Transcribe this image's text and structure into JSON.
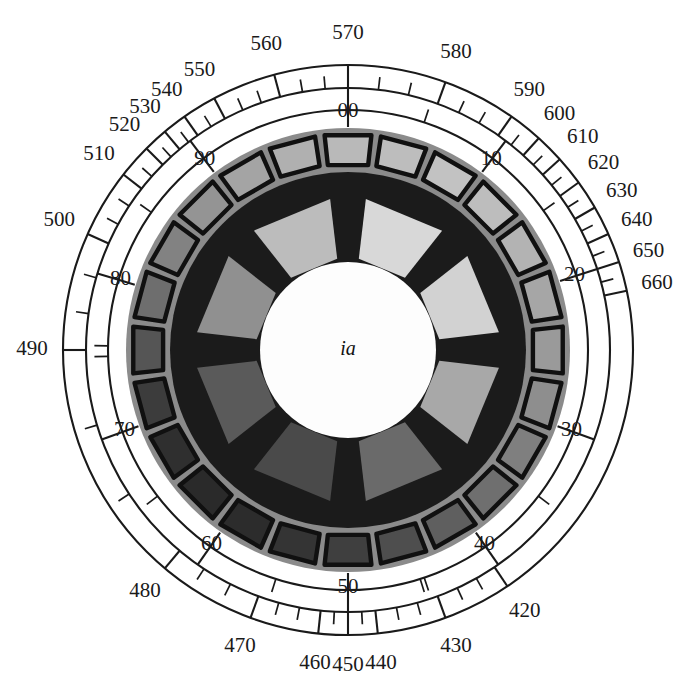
{
  "figure": {
    "type": "machine-cross-section-with-angular-scale",
    "center_label": "ia",
    "background_color": "#ffffff",
    "line_color": "#1a1a1a"
  },
  "outer_scale": {
    "name": "outer-graduated-ring",
    "labels": [
      "420",
      "430",
      "440",
      "450",
      "460",
      "470",
      "480",
      "490",
      "500",
      "510",
      "520",
      "530",
      "540",
      "550",
      "560",
      "570",
      "580",
      "590",
      "600",
      "610",
      "620",
      "630",
      "640",
      "650",
      "660"
    ],
    "label_angles_deg": [
      56,
      70,
      84,
      90,
      96,
      110,
      130,
      180,
      204,
      218,
      225,
      230,
      235,
      242,
      255,
      270,
      290,
      305,
      312,
      318,
      324,
      330,
      336,
      342,
      348
    ],
    "label_radius": 316
  },
  "inner_scale": {
    "name": "inner-graduated-ring",
    "labels": [
      "00",
      "10",
      "20",
      "30",
      "40",
      "50",
      "60",
      "70",
      "80",
      "90"
    ],
    "label_angles_deg": [
      270,
      307,
      342,
      20,
      55,
      90,
      125,
      160,
      197,
      233
    ],
    "label_radius": 238
  },
  "stator": {
    "name": "stator-slot-ring",
    "slot_count": 24,
    "outer_radius": 222,
    "inner_radius": 182,
    "slot_shades": [
      "#b9b9b9",
      "#bdbdbd",
      "#c2c2c2",
      "#bdbdbd",
      "#b3b3b3",
      "#a6a6a6",
      "#9a9a9a",
      "#8e8e8e",
      "#7f7f7f",
      "#6f6f6f",
      "#5f5f5f",
      "#4e4e4e",
      "#3f3f3f",
      "#343434",
      "#2c2c2c",
      "#2a2a2a",
      "#2f2f2f",
      "#3c3c3c",
      "#555555",
      "#6e6e6e",
      "#828282",
      "#949494",
      "#a4a4a4",
      "#b0b0b0"
    ],
    "ring_fill": "#8b8b8b",
    "slot_stroke": "#101010"
  },
  "core": {
    "name": "rotor-core-disc",
    "radius": 178,
    "fill": "#1b1b1b"
  },
  "rotor": {
    "name": "rotor-pole-ring",
    "pole_count": 8,
    "outer_radius": 152,
    "inner_radius": 92,
    "pole_shades": [
      "#d8d8d8",
      "#d2d2d2",
      "#a8a8a8",
      "#6a6a6a",
      "#4a4a4a",
      "#5a5a5a",
      "#909090",
      "#bcbcbc"
    ]
  },
  "hub": {
    "name": "center-hub",
    "radius": 88,
    "fill": "#fdfdfd",
    "label": "ia"
  }
}
